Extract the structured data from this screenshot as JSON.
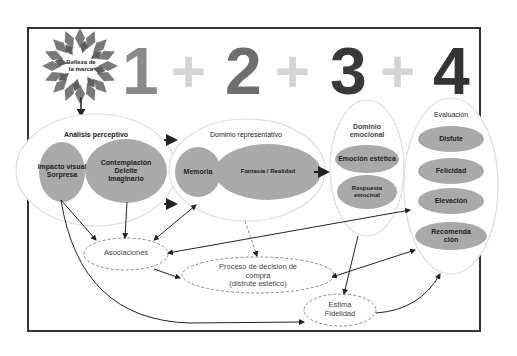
{
  "title_badge": {
    "label": "Belleza de\nla marca",
    "line1": "Belleza de",
    "line2": "la marca",
    "icon": "starburst-icon"
  },
  "sequence": {
    "items": [
      {
        "text": "1",
        "color": "#8a8a8a"
      },
      {
        "text": "+",
        "color": "#d4d4d4"
      },
      {
        "text": "2",
        "color": "#6e6e6e"
      },
      {
        "text": "+",
        "color": "#d4d4d4"
      },
      {
        "text": "3",
        "color": "#3a3a3a"
      },
      {
        "text": "+",
        "color": "#d4d4d4"
      },
      {
        "text": "4",
        "color": "#333333"
      }
    ]
  },
  "stages": {
    "analisis": {
      "title": "Análisis perceptivo",
      "items": [
        {
          "line1": "Impacto visual",
          "line2": "Sorpresa"
        },
        {
          "line1": "Contemplación",
          "line2": "Deleite",
          "line3": "Imaginario"
        }
      ]
    },
    "representativo": {
      "title": "Dominio representativo",
      "items": [
        {
          "label": "Memoria"
        },
        {
          "label": "Fantasía / Realidad"
        }
      ]
    },
    "emocional": {
      "title_line1": "Dominio",
      "title_line2": "emocional",
      "items": [
        {
          "label": "Emoción estética"
        },
        {
          "line1": "Respuesta",
          "line2": "emocinal"
        }
      ]
    },
    "evaluacion": {
      "title": "Evaluación",
      "items": [
        {
          "label": "Disfute"
        },
        {
          "label": "Felicidad"
        },
        {
          "label": "Elevación"
        },
        {
          "line1": "Recomenda",
          "line2": "ción"
        }
      ]
    }
  },
  "outcomes": {
    "asociaciones": {
      "label": "Asociaciones"
    },
    "proceso": {
      "line1": "Proceso de decision de",
      "line2": "compra",
      "line3": "(disfrute estético)"
    },
    "estima": {
      "line1": "Estima",
      "line2": "Fidelidad"
    }
  },
  "colors": {
    "frame": "#333333",
    "ellipse_fill": "#a9a9a9",
    "container_stroke": "#dcdcdc",
    "arrow": "#222222",
    "dashed": "#888888"
  }
}
